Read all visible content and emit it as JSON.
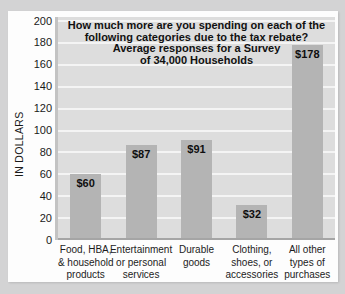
{
  "page": {
    "background_color": "#d3d3d4",
    "card_color": "#fdfdfd"
  },
  "chart_data": {
    "type": "bar",
    "title_lines": [
      "How much more are you spending on each of the",
      "following categories due to the tax rebate?",
      "Average responses for a Survey",
      "of 34,000 Households"
    ],
    "ylabel": "IN DOLLARS",
    "xlabel": "",
    "categories": [
      "Food, HBA,\n& household\nproducts",
      "Entertainment\nor personal\nservices",
      "Durable\ngoods",
      "Clothing,\nshoes, or\naccessories",
      "All other\ntypes of\npurchases"
    ],
    "values": [
      60,
      87,
      91,
      32,
      178
    ],
    "value_labels": [
      "$60",
      "$87",
      "$91",
      "$32",
      "$178"
    ],
    "ylim": [
      0,
      200
    ],
    "yticks": [
      0,
      20,
      40,
      60,
      80,
      100,
      120,
      140,
      160,
      180,
      200
    ],
    "grid": "horizontal",
    "legend": "none",
    "colors": {
      "bar": "#b4b4b4",
      "plot_background": "#dddddd",
      "gridline": "#f4f4f4",
      "y_axis_line": "#c3c3c3",
      "x_axis_line": "#a5a5a5",
      "text": "#111111"
    }
  }
}
